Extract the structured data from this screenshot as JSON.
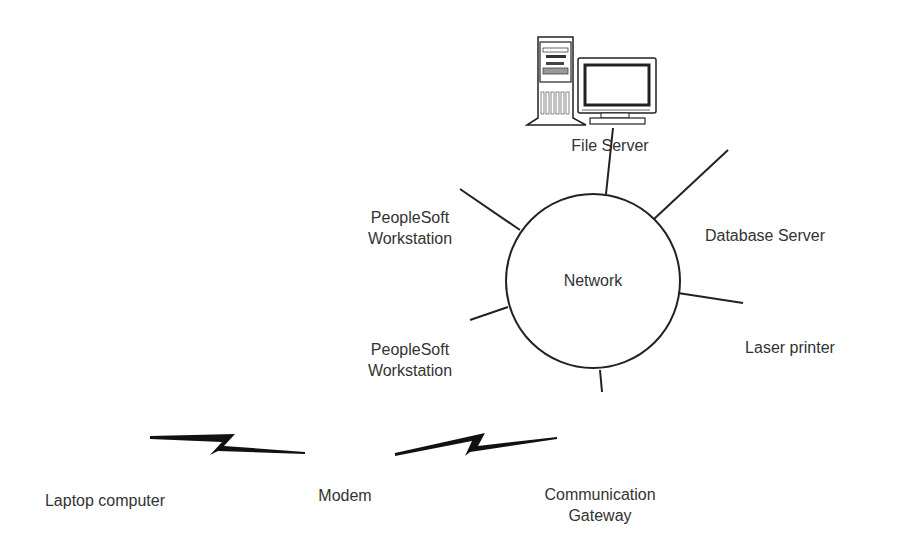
{
  "diagram": {
    "type": "network-topology",
    "colors": {
      "line": "#222222",
      "text": "#333333",
      "fill_gray": "#b0b0b0",
      "background": "#ffffff"
    },
    "center": {
      "label": "Network",
      "icon": "network-circle-icon"
    },
    "nodes": [
      {
        "id": "file-server",
        "label": "File Server",
        "icon": "file-server-icon"
      },
      {
        "id": "database-server",
        "label": "Database Server",
        "icon": "database-server-icon"
      },
      {
        "id": "workstation-1",
        "label_line1": "PeopleSoft",
        "label_line2": "Workstation",
        "icon": "desktop-workstation-icon"
      },
      {
        "id": "workstation-2",
        "label_line1": "PeopleSoft",
        "label_line2": "Workstation",
        "icon": "desktop-workstation-icon"
      },
      {
        "id": "laser-printer",
        "label": "Laser printer",
        "icon": "printer-icon"
      },
      {
        "id": "communication-gateway",
        "label_line1": "Communication",
        "label_line2": "Gateway",
        "icon": "monitor-icon"
      },
      {
        "id": "modem",
        "label": "Modem",
        "icon": "modem-icon"
      },
      {
        "id": "laptop",
        "label": "Laptop computer",
        "icon": "laptop-icon"
      }
    ],
    "edges": [
      {
        "from": "file-server",
        "to": "network",
        "kind": "wired"
      },
      {
        "from": "database-server",
        "to": "network",
        "kind": "wired"
      },
      {
        "from": "workstation-1",
        "to": "network",
        "kind": "wired"
      },
      {
        "from": "workstation-2",
        "to": "network",
        "kind": "wired"
      },
      {
        "from": "laser-printer",
        "to": "network",
        "kind": "wired"
      },
      {
        "from": "communication-gateway",
        "to": "network",
        "kind": "wired"
      },
      {
        "from": "modem",
        "to": "communication-gateway",
        "kind": "dial-up"
      },
      {
        "from": "laptop",
        "to": "modem",
        "kind": "dial-up"
      }
    ]
  }
}
